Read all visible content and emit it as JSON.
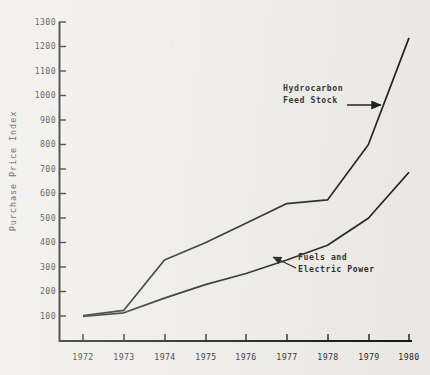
{
  "chart_data": {
    "type": "line",
    "title": "",
    "xlabel": "",
    "ylabel": "Purchase Price Index",
    "x": [
      1972,
      1973,
      1974,
      1975,
      1976,
      1977,
      1978,
      1979,
      1980
    ],
    "xtick_labels": [
      "1972",
      "1973",
      "1974",
      "1975",
      "1976",
      "1977",
      "1978",
      "1979",
      "1980"
    ],
    "xlim": [
      1972,
      1980
    ],
    "ytick_labels": [
      "100",
      "200",
      "300",
      "400",
      "500",
      "600",
      "700",
      "800",
      "900",
      "1000",
      "1100",
      "1200",
      "1300"
    ],
    "yticks": [
      100,
      200,
      300,
      400,
      500,
      600,
      700,
      800,
      900,
      1000,
      1100,
      1200,
      1300
    ],
    "ylim": [
      0,
      1300
    ],
    "grid": false,
    "legend": "annotations",
    "series": [
      {
        "name": "Hydrocarbon Feed Stock",
        "values": [
          103,
          125,
          330,
          400,
          480,
          560,
          575,
          800,
          1235
        ],
        "color": "#1a1a1a"
      },
      {
        "name": "Fuels and Electric Power",
        "values": [
          100,
          115,
          175,
          230,
          275,
          330,
          390,
          500,
          688
        ],
        "color": "#1a1a1a"
      }
    ],
    "annotations": [
      {
        "name": "hydrocarbon-feed-stock",
        "line1": "Hydrocarbon",
        "line2": "Feed Stock",
        "arrow": "right"
      },
      {
        "name": "fuels-and-electric-power",
        "line1": "Fuels and",
        "line2": "Electric Power",
        "arrow": "up-left"
      }
    ],
    "axis_color": "#111111"
  }
}
